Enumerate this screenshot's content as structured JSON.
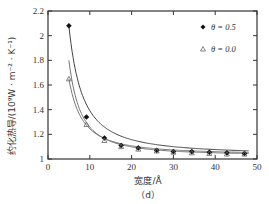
{
  "chart_data": {
    "type": "scatter",
    "title": "",
    "subtitle": "(d)",
    "xlabel": "宽度/Å",
    "ylabel": "约化热导/(10⁹W · m⁻² · K⁻¹)",
    "xlim": [
      0,
      50
    ],
    "ylim": [
      1,
      2.2
    ],
    "xticks": [
      0,
      10,
      20,
      30,
      40,
      50
    ],
    "yticks": [
      1,
      1.2,
      1.4,
      1.6,
      1.8,
      2,
      2.2
    ],
    "ytick_labels": [
      "1",
      "1.2",
      "1.4",
      "1.6",
      "1.8",
      "2",
      "2.2"
    ],
    "grid": false,
    "legend_position": "upper right",
    "series": [
      {
        "name": "θ = 0.5",
        "marker": "filled-diamond",
        "color": "#222222",
        "x": [
          5.0,
          9.2,
          13.5,
          17.5,
          21.6,
          26.0,
          30.0,
          34.4,
          38.6,
          42.8,
          47.0
        ],
        "y": [
          2.08,
          1.34,
          1.17,
          1.11,
          1.09,
          1.07,
          1.06,
          1.06,
          1.055,
          1.05,
          1.045
        ]
      },
      {
        "name": "θ = 0.0",
        "marker": "open-triangle",
        "color": "#555555",
        "x": [
          5.0,
          9.2,
          13.5,
          17.5,
          21.6,
          26.0,
          30.0,
          34.4,
          38.6,
          42.8,
          47.0
        ],
        "y": [
          1.65,
          1.28,
          1.15,
          1.1,
          1.08,
          1.065,
          1.055,
          1.05,
          1.045,
          1.04,
          1.04
        ]
      }
    ]
  },
  "legend": {
    "items": [
      {
        "label": "θ = 0.5",
        "marker": "diamond-icon"
      },
      {
        "label": "θ = 0.0",
        "marker": "triangle-icon"
      }
    ]
  },
  "labels": {
    "xlabel": "宽度/Å",
    "ylabel": "约化热导/(10⁹W · m⁻² · K⁻¹)",
    "caption": "（d）"
  }
}
